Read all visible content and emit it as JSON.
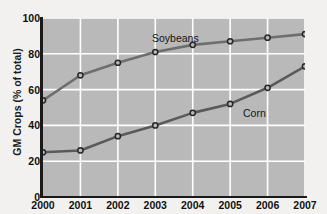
{
  "chart_data": {
    "type": "line",
    "title": "",
    "xlabel": "",
    "ylabel": "GM Crops (% of total)",
    "categories": [
      "2000",
      "2001",
      "2002",
      "2003",
      "2004",
      "2005",
      "2006",
      "2007"
    ],
    "x": [
      2000,
      2001,
      2002,
      2003,
      2004,
      2005,
      2006,
      2007
    ],
    "xlim": [
      2000,
      2007
    ],
    "ylim": [
      0,
      100
    ],
    "yticks": [
      0,
      20,
      40,
      60,
      80,
      100
    ],
    "ytick_labels": [
      "0",
      "20",
      "40",
      "60",
      "80",
      "100"
    ],
    "grid": true,
    "grid_color": "#ffffff",
    "plot_background": "#b9b9b9",
    "legend": "inline-annotations",
    "series": [
      {
        "name": "Soybeans",
        "label": "Soybeans",
        "color": "#6e6e6e",
        "marker": "circle-open",
        "values": [
          54,
          68,
          75,
          81,
          85,
          87,
          89,
          91
        ]
      },
      {
        "name": "Corn",
        "label": "Corn",
        "color": "#5a5a5a",
        "marker": "circle-open",
        "values": [
          25,
          26,
          34,
          40,
          47,
          52,
          61,
          73
        ]
      }
    ],
    "annotations": [
      {
        "text": "Soybeans",
        "x": 2003.0,
        "y": 90
      },
      {
        "text": "Corn",
        "x": 2005.6,
        "y": 53
      }
    ]
  }
}
